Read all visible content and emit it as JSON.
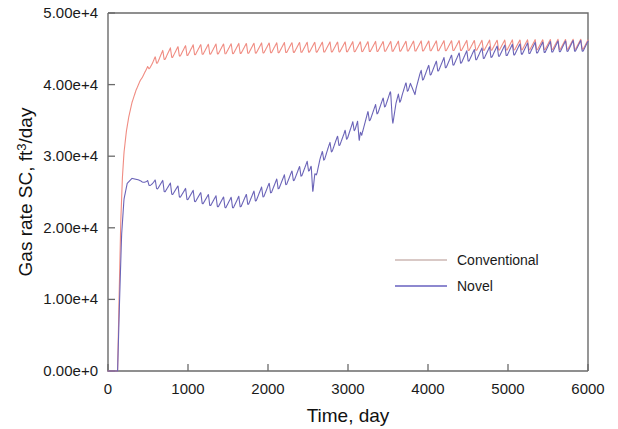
{
  "chart_data": {
    "type": "line",
    "title": "",
    "xlabel": "Time, day",
    "ylabel": "Gas rate SC, ft3/day",
    "ylabel_display": "Gas rate SC, ft",
    "ylabel_sup": "3",
    "ylabel_tail": "/day",
    "xlim": [
      0,
      6000
    ],
    "ylim": [
      0,
      50000
    ],
    "xticks": [
      0,
      1000,
      2000,
      3000,
      4000,
      5000,
      6000
    ],
    "xtick_labels": [
      "0",
      "1000",
      "2000",
      "3000",
      "4000",
      "5000",
      "6000"
    ],
    "yticks": [
      0,
      10000,
      20000,
      30000,
      40000,
      50000
    ],
    "ytick_labels": [
      "0.00e+0",
      "1.00e+4",
      "2.00e+4",
      "3.00e+4",
      "4.00e+4",
      "5.00e+4"
    ],
    "grid": false,
    "legend_position": "center-right",
    "series": [
      {
        "name": "Conventional",
        "color": "#f08c82",
        "linewidth": 1.1,
        "oscillation_amplitude": 1400,
        "oscillation_period_days": 95,
        "x": [
          0,
          120,
          140,
          160,
          180,
          200,
          230,
          260,
          300,
          350,
          400,
          460,
          520,
          600,
          700,
          800,
          900,
          1000,
          1100,
          1200,
          1400,
          1600,
          1800,
          2000,
          2300,
          2600,
          3000,
          3400,
          3800,
          4200,
          4600,
          5000,
          5400,
          5800
        ],
        "y": [
          0,
          0,
          11000,
          21000,
          27000,
          30500,
          33500,
          35500,
          37500,
          39200,
          40500,
          41600,
          42400,
          43100,
          43700,
          44000,
          44200,
          44300,
          44400,
          44450,
          44500,
          44550,
          44600,
          44650,
          44700,
          44750,
          44800,
          44850,
          44900,
          44950,
          45000,
          45050,
          45100,
          45150
        ]
      },
      {
        "name": "Novel",
        "color": "#6b64b8",
        "linewidth": 1.1,
        "oscillation_amplitude": 1500,
        "oscillation_period_days": 95,
        "x": [
          0,
          120,
          145,
          170,
          200,
          240,
          300,
          380,
          450,
          550,
          650,
          750,
          850,
          950,
          1050,
          1150,
          1250,
          1350,
          1450,
          1550,
          1650,
          1750,
          1850,
          1950,
          2050,
          2150,
          2250,
          2350,
          2450,
          2540,
          2560,
          2600,
          2650,
          2750,
          2850,
          2950,
          3050,
          3120,
          3140,
          3180,
          3250,
          3350,
          3450,
          3530,
          3560,
          3600,
          3680,
          3780,
          3820,
          3850,
          3900,
          4000,
          4100,
          4200,
          4300,
          4400,
          4500,
          4700,
          4900,
          5100,
          5300,
          5500,
          5700,
          5800
        ],
        "y": [
          0,
          0,
          10000,
          19000,
          24000,
          26200,
          26900,
          26700,
          26300,
          25900,
          25500,
          25100,
          24700,
          24300,
          24000,
          23700,
          23400,
          23200,
          23050,
          23000,
          23150,
          23500,
          24000,
          24600,
          25200,
          25800,
          26400,
          27000,
          27700,
          28400,
          24200,
          27500,
          29000,
          30400,
          31400,
          32200,
          33400,
          34400,
          31200,
          33600,
          35000,
          36000,
          37000,
          37900,
          34800,
          36800,
          38400,
          39800,
          37800,
          39600,
          40600,
          41400,
          42000,
          42500,
          42900,
          43200,
          43500,
          43900,
          44200,
          44400,
          44600,
          44750,
          44850,
          44900
        ]
      }
    ]
  },
  "legend": {
    "items": [
      {
        "label": "Conventional",
        "color": "#d9c9c6"
      },
      {
        "label": "Novel",
        "color": "#8d88cf"
      }
    ]
  },
  "axes": {
    "x_title": "Time, day",
    "y_title_main": "Gas rate SC, ft",
    "y_title_sup": "3",
    "y_title_tail": "/day"
  }
}
